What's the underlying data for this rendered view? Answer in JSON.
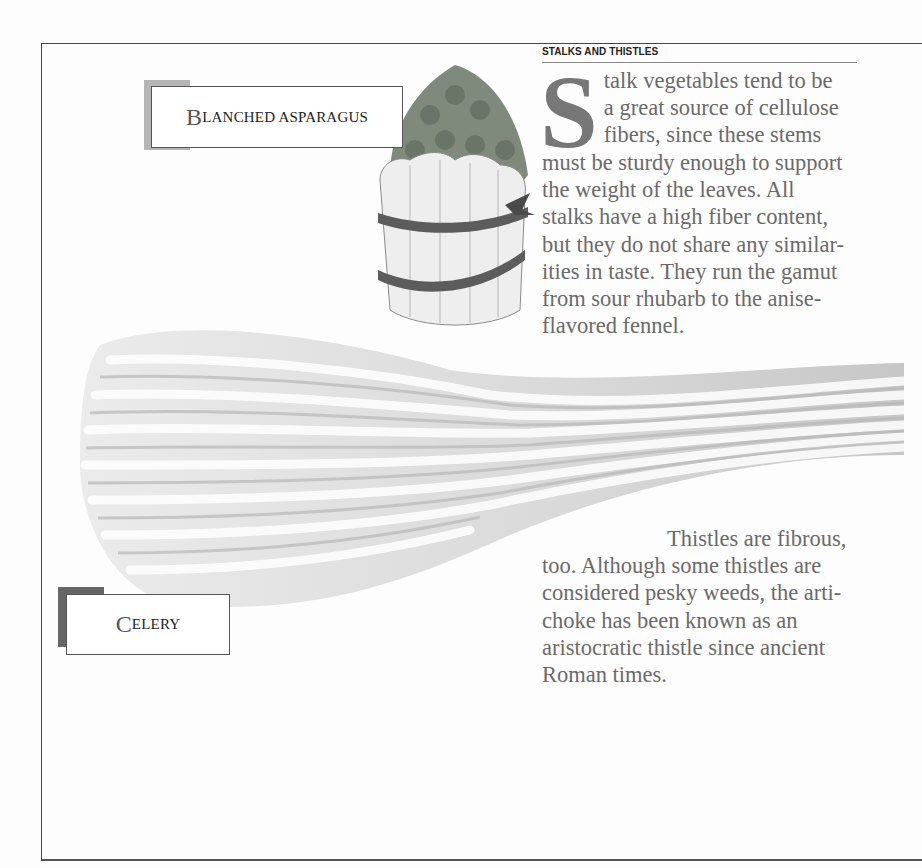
{
  "section": {
    "label": "STALKS AND THISTLES"
  },
  "paragraph1": {
    "dropcap": "S",
    "lines": [
      "talk vegetables tend to be",
      "a great source of cellulose",
      "fibers, since these stems",
      "must be sturdy enough to support",
      "the weight of the leaves. All",
      "stalks have a high fiber content,",
      "but they do not share any similar-",
      "ities in taste. They run the gamut",
      "from sour rhubarb to the anise-",
      "flavored fennel."
    ]
  },
  "paragraph2": {
    "lines": [
      "Thistles are fibrous,",
      "too. Although some thistles are",
      "considered pesky weeds, the arti-",
      "choke has been known as an",
      "aristocratic thistle since ancient",
      "Roman times."
    ]
  },
  "labels": {
    "asparagus": {
      "initial": "B",
      "rest": "LANCHED ASPARAGUS"
    },
    "celery": {
      "initial": "C",
      "rest": "ELERY"
    }
  },
  "illustrations": {
    "asparagus": "asparagus-bundle-illustration",
    "celery": "celery-stalk-illustration"
  },
  "colors": {
    "text": "#6a6a6a",
    "frame": "#444444",
    "asparagus_tab": "#b5b5b5",
    "celery_tab": "#666666"
  }
}
